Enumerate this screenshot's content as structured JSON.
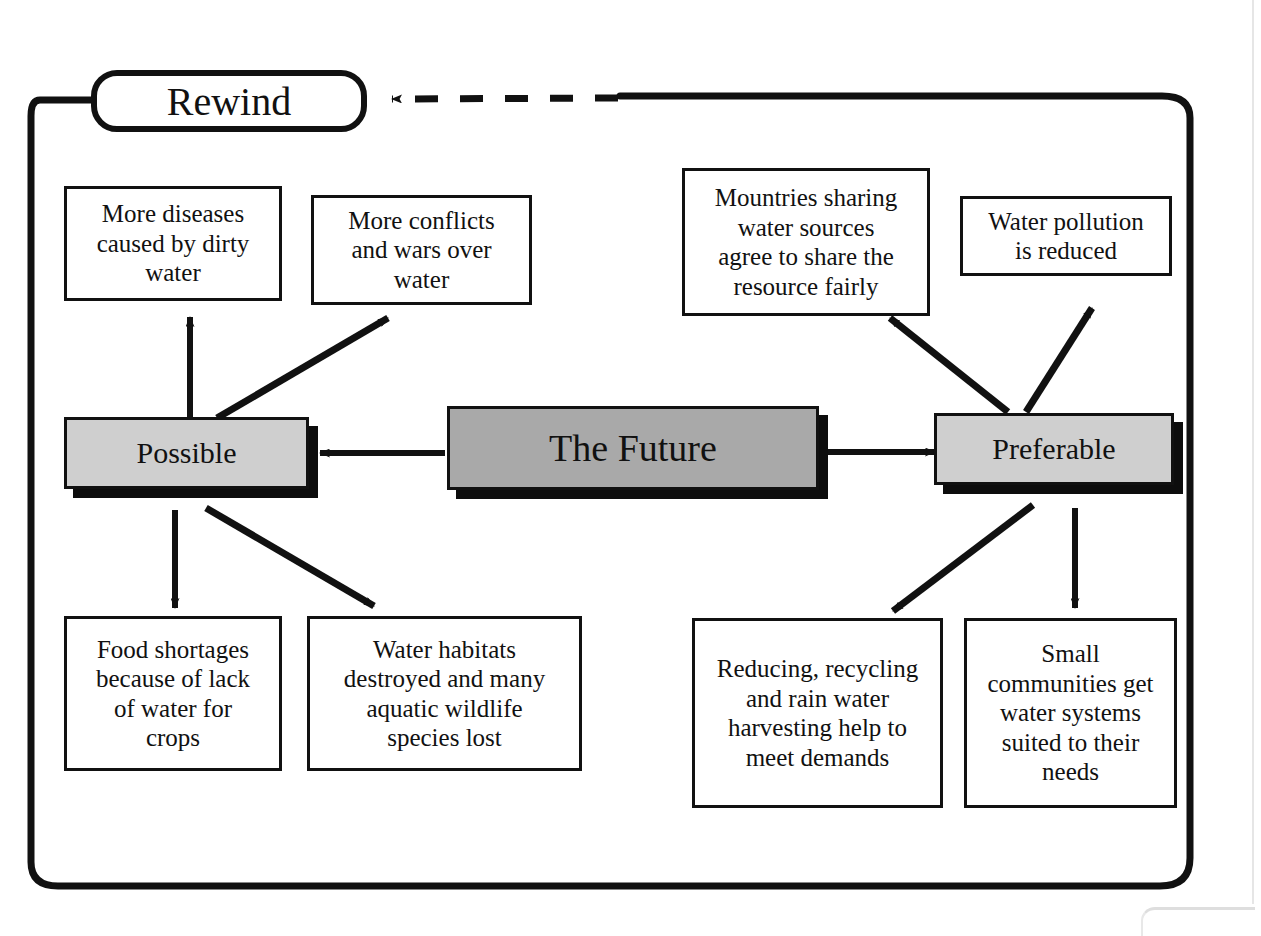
{
  "diagram": {
    "rewind": {
      "label": "Rewind"
    },
    "central": {
      "label": "The Future"
    },
    "branches": [
      {
        "key": "possible",
        "label": "Possible",
        "outcomes": [
          "More diseases\ncaused by dirty\nwater",
          "More conflicts\nand wars over\nwater",
          "Food shortages\nbecause of lack\nof water for\ncrops",
          "Water habitats\ndestroyed and many\naquatic wildlife\nspecies lost"
        ]
      },
      {
        "key": "preferable",
        "label": "Preferable",
        "outcomes": [
          "Mountries sharing\nwater sources\nagree to share the\nresource fairly",
          "Water pollution\nis reduced",
          "Reducing, recycling\nand rain water\nharvesting  help to\nmeet demands",
          "Small\ncommunities get\nwater systems\nsuited to their\nneeds"
        ]
      }
    ],
    "colors": {
      "ink": "#111111",
      "central_fill": "#a9a9a9",
      "category_fill": "#cfcfcf",
      "shadow": "#0d0d0d",
      "paper": "#ffffff"
    }
  }
}
